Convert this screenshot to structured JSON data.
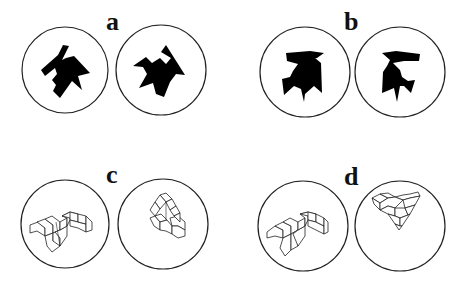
{
  "figure": {
    "panels": [
      {
        "label": "a",
        "type": "2D polygon pair"
      },
      {
        "label": "b",
        "type": "2D polygon pair"
      },
      {
        "label": "c",
        "type": "3D cube figure pair"
      },
      {
        "label": "d",
        "type": "3D cube figure pair"
      }
    ]
  }
}
